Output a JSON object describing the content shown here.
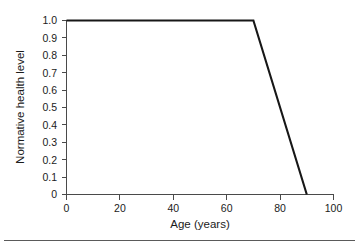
{
  "chart_data": {
    "type": "line",
    "title": "",
    "xlabel": "Age (years)",
    "ylabel": "Normative health level",
    "xlim": [
      0,
      100
    ],
    "ylim": [
      0,
      1.0
    ],
    "grid": false,
    "legend": null,
    "x_ticks": [
      0,
      20,
      40,
      60,
      80,
      100
    ],
    "x_tick_labels": [
      "0",
      "20",
      "40",
      "60",
      "80",
      "100"
    ],
    "y_ticks": [
      0,
      0.1,
      0.2,
      0.3,
      0.4,
      0.5,
      0.6,
      0.7,
      0.8,
      0.9,
      1.0
    ],
    "y_tick_labels": [
      "0",
      "0.1",
      "0.2",
      "0.3",
      "0.4",
      "0.5",
      "0.6",
      "0.7",
      "0.8",
      "0.9",
      "1.0"
    ],
    "series": [
      {
        "name": "Normative health level",
        "color": "#171717",
        "x": [
          0,
          70,
          90
        ],
        "values": [
          1.0,
          1.0,
          0.0
        ]
      }
    ],
    "annotations": []
  },
  "figure": {
    "background_color": "#ffffff",
    "axis_color": "#4a4a4a",
    "text_color": "#1b1b1b",
    "footer_rule": true
  }
}
